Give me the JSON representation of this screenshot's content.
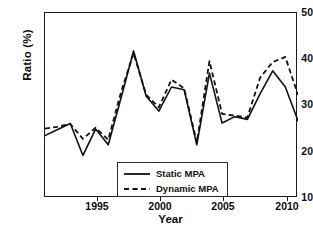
{
  "chart_data": {
    "type": "line",
    "title": "",
    "xlabel": "Year",
    "ylabel": "Ratio (%)",
    "xlim": [
      1992,
      2012
    ],
    "ylim": [
      10,
      50
    ],
    "xticks": [
      1995,
      2000,
      2005,
      2010
    ],
    "yticks": [
      10,
      20,
      30,
      40,
      50
    ],
    "grid": false,
    "legend_position": "bottom-center",
    "x": [
      1992,
      1993,
      1994,
      1995,
      1996,
      1997,
      1998,
      1999,
      2000,
      2001,
      2002,
      2003,
      2004,
      2005,
      2006,
      2007,
      2008,
      2009,
      2010,
      2011,
      2012
    ],
    "series": [
      {
        "name": "Static MPA",
        "style": "solid",
        "color": "#111111",
        "values": [
          23.5,
          24.8,
          26.1,
          19.2,
          24.9,
          21.5,
          31.5,
          41.8,
          32.0,
          28.8,
          34.0,
          33.4,
          21.5,
          37.0,
          26.2,
          27.6,
          27.0,
          32.5,
          37.5,
          34.0,
          26.7
        ]
      },
      {
        "name": "Dynamic MPA",
        "style": "dashed",
        "color": "#111111",
        "values": [
          25.0,
          25.4,
          26.0,
          22.8,
          25.2,
          22.6,
          32.8,
          41.3,
          32.3,
          29.6,
          35.6,
          33.7,
          22.0,
          39.6,
          28.2,
          27.8,
          27.4,
          36.0,
          39.4,
          40.5,
          32.3
        ]
      }
    ]
  },
  "axes": {
    "ytick_labels": [
      "50",
      "40",
      "30",
      "20",
      "10"
    ],
    "xtick_labels": [
      "1995",
      "2000",
      "2005",
      "2010"
    ],
    "ylabel_text": "Ratio (%)",
    "xlabel_text": "Year"
  },
  "legend": {
    "entries": [
      {
        "label": "Static MPA",
        "style": "solid"
      },
      {
        "label": "Dynamic MPA",
        "style": "dashed"
      }
    ]
  }
}
